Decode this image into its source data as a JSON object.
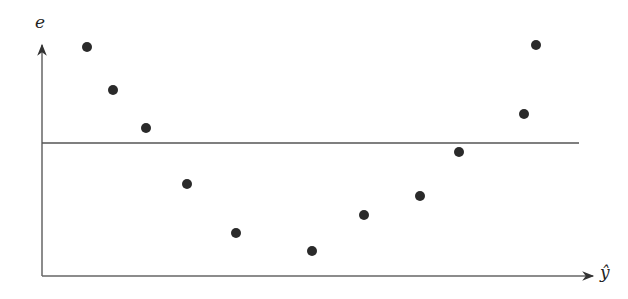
{
  "chart_data": {
    "type": "scatter",
    "title": "",
    "xlabel": "ŷ",
    "ylabel": "e",
    "grid": false,
    "legend": null,
    "reference_line": {
      "y": 0,
      "description": "horizontal zero-residual line"
    },
    "points_px": [
      [
        87,
        47
      ],
      [
        113,
        90
      ],
      [
        146,
        128
      ],
      [
        187,
        184
      ],
      [
        236,
        233
      ],
      [
        312,
        251
      ],
      [
        364,
        215
      ],
      [
        420,
        196
      ],
      [
        459,
        152
      ],
      [
        524,
        114
      ],
      [
        536,
        45
      ]
    ],
    "x": [
      1,
      2,
      3,
      4,
      5,
      6,
      7,
      8,
      9,
      10,
      11
    ],
    "values": [
      2.0,
      1.1,
      0.3,
      -0.85,
      -1.9,
      -2.25,
      -1.5,
      -1.1,
      -0.2,
      0.6,
      2.05
    ]
  },
  "axes": {
    "y_label": "e",
    "x_label": "ŷ",
    "color": "#555555",
    "point_color": "#2a2a2a"
  }
}
